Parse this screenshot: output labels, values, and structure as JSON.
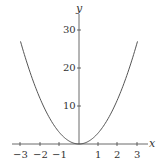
{
  "chart_data": {
    "type": "line",
    "title": "",
    "xlabel": "x",
    "ylabel": "y",
    "function": "y = 3x^2",
    "x": [
      -3,
      -2.5,
      -2,
      -1.5,
      -1,
      -0.5,
      0,
      0.5,
      1,
      1.5,
      2,
      2.5,
      3
    ],
    "series": [
      {
        "name": "y = 3x^2",
        "values": [
          27,
          18.75,
          12,
          6.75,
          3,
          0.75,
          0,
          0.75,
          3,
          6.75,
          12,
          18.75,
          27
        ]
      }
    ],
    "xlim": [
      -3.3,
      3.3
    ],
    "ylim": [
      0,
      32
    ],
    "x_ticks": [
      "−3",
      "−2",
      "−1",
      "1",
      "2",
      "3"
    ],
    "y_ticks": [
      "10",
      "20",
      "30"
    ],
    "grid": false,
    "line_color": "#555555"
  }
}
